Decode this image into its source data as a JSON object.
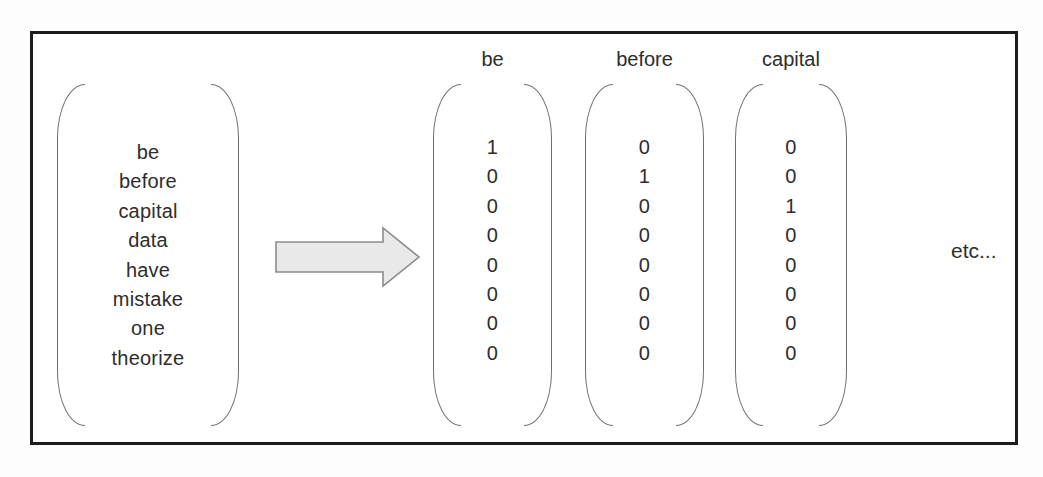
{
  "figure": {
    "vocabulary": {
      "words": [
        "be",
        "before",
        "capital",
        "data",
        "have",
        "mistake",
        "one",
        "theorize"
      ]
    },
    "vectors": [
      {
        "label": "be",
        "values": [
          "1",
          "0",
          "0",
          "0",
          "0",
          "0",
          "0",
          "0"
        ]
      },
      {
        "label": "before",
        "values": [
          "0",
          "1",
          "0",
          "0",
          "0",
          "0",
          "0",
          "0"
        ]
      },
      {
        "label": "capital",
        "values": [
          "0",
          "0",
          "1",
          "0",
          "0",
          "0",
          "0",
          "0"
        ]
      }
    ],
    "etc_label": "etc...",
    "icons": {
      "arrow": "right-block-arrow"
    },
    "colors": {
      "frame_border": "#1c1c1c",
      "bracket": "#6f6f6f",
      "text": "#2d2d2d",
      "arrow_fill": "#e9e9e9",
      "arrow_stroke": "#8c8c8c",
      "background": "#ffffff"
    }
  }
}
